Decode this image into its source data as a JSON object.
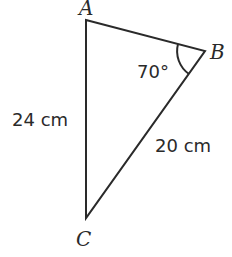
{
  "diagram": {
    "type": "triangle",
    "vertices": {
      "A": {
        "label": "A",
        "x": 86,
        "y": 20
      },
      "B": {
        "label": "B",
        "x": 205,
        "y": 51
      },
      "C": {
        "label": "C",
        "x": 86,
        "y": 218
      }
    },
    "sides": {
      "AC": {
        "label": "24 cm"
      },
      "BC": {
        "label": "20 cm"
      }
    },
    "angles": {
      "B": {
        "label": "70°"
      }
    },
    "colors": {
      "stroke": "#2a2a2a",
      "background": "#ffffff"
    }
  }
}
